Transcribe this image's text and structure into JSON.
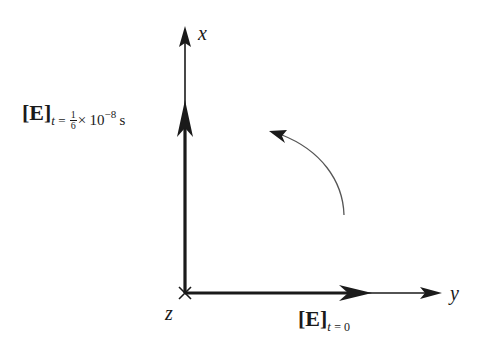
{
  "figure": {
    "axes": {
      "x_label": "x",
      "y_label": "y",
      "z_label": "z"
    },
    "vector_x": {
      "symbol": "[E]",
      "subscript_var": "t",
      "subscript_eq": "=",
      "frac_num": "1",
      "frac_den": "6",
      "times": "×",
      "mantissa": "10",
      "exponent": "−8",
      "unit": "s"
    },
    "vector_y": {
      "symbol": "[E]",
      "subscript_var": "t",
      "subscript_eq": "= 0"
    },
    "rotation_arrow": "counterclockwise-arc",
    "colors": {
      "ink": "#1a1a1a",
      "arc": "#555555",
      "background": "#ffffff"
    }
  }
}
